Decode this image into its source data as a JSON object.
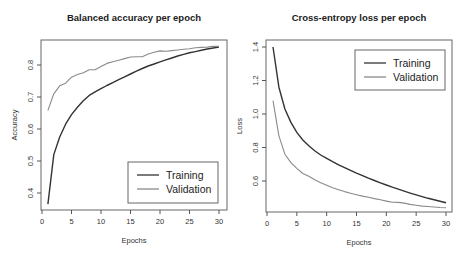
{
  "colors": {
    "training": "#333333",
    "validation": "#8a8a8a",
    "axis": "#555555",
    "box": "#666666"
  },
  "chart_data": [
    {
      "type": "line",
      "title": "Balanced accuracy per epoch",
      "xlabel": "Epochs",
      "ylabel": "Accuracy",
      "xlim": [
        0,
        30
      ],
      "ylim": [
        0.36,
        0.87
      ],
      "xticks": [
        0,
        5,
        10,
        15,
        20,
        25,
        30
      ],
      "yticks": [
        0.4,
        0.5,
        0.6,
        0.7,
        0.8
      ],
      "ytick_labels": [
        "0.4",
        "0.5",
        "0.6",
        "0.7",
        "0.8"
      ],
      "grid": false,
      "legend": {
        "position": "bottomright",
        "entries": [
          "Training",
          "Validation"
        ]
      },
      "x": [
        1,
        2,
        3,
        4,
        5,
        6,
        7,
        8,
        9,
        10,
        11,
        12,
        13,
        14,
        15,
        16,
        17,
        18,
        19,
        20,
        21,
        22,
        23,
        24,
        25,
        26,
        27,
        28,
        29,
        30
      ],
      "series": [
        {
          "name": "Training",
          "values": [
            0.365,
            0.52,
            0.575,
            0.615,
            0.645,
            0.668,
            0.688,
            0.705,
            0.716,
            0.726,
            0.736,
            0.745,
            0.754,
            0.763,
            0.772,
            0.781,
            0.789,
            0.797,
            0.803,
            0.81,
            0.816,
            0.822,
            0.828,
            0.833,
            0.838,
            0.842,
            0.846,
            0.85,
            0.853,
            0.856
          ]
        },
        {
          "name": "Validation",
          "values": [
            0.658,
            0.71,
            0.735,
            0.743,
            0.762,
            0.77,
            0.776,
            0.785,
            0.785,
            0.795,
            0.805,
            0.81,
            0.815,
            0.82,
            0.825,
            0.826,
            0.826,
            0.834,
            0.84,
            0.844,
            0.843,
            0.845,
            0.847,
            0.849,
            0.851,
            0.854,
            0.855,
            0.856,
            0.858,
            0.858
          ]
        }
      ]
    },
    {
      "type": "line",
      "title": "Cross-entropy loss per epoch",
      "xlabel": "Epochs",
      "ylabel": "Loss",
      "xlim": [
        0,
        30
      ],
      "ylim": [
        0.42,
        1.42
      ],
      "xticks": [
        0,
        5,
        10,
        15,
        20,
        25,
        30
      ],
      "yticks": [
        0.6,
        0.8,
        1.0,
        1.2,
        1.4
      ],
      "ytick_labels": [
        "0.6",
        "0.8",
        "1.0",
        "1.2",
        "1.4"
      ],
      "grid": false,
      "legend": {
        "position": "topright",
        "entries": [
          "Training",
          "Validation"
        ]
      },
      "x": [
        1,
        2,
        3,
        4,
        5,
        6,
        7,
        8,
        9,
        10,
        11,
        12,
        13,
        14,
        15,
        16,
        17,
        18,
        19,
        20,
        21,
        22,
        23,
        24,
        25,
        26,
        27,
        28,
        29,
        30
      ],
      "series": [
        {
          "name": "Training",
          "values": [
            1.4,
            1.16,
            1.03,
            0.95,
            0.89,
            0.845,
            0.81,
            0.78,
            0.755,
            0.735,
            0.715,
            0.697,
            0.68,
            0.663,
            0.647,
            0.632,
            0.617,
            0.603,
            0.589,
            0.576,
            0.563,
            0.551,
            0.539,
            0.528,
            0.517,
            0.507,
            0.497,
            0.488,
            0.479,
            0.47
          ]
        },
        {
          "name": "Validation",
          "values": [
            1.08,
            0.87,
            0.76,
            0.71,
            0.675,
            0.645,
            0.628,
            0.607,
            0.59,
            0.575,
            0.56,
            0.548,
            0.537,
            0.527,
            0.518,
            0.51,
            0.503,
            0.495,
            0.488,
            0.48,
            0.473,
            0.472,
            0.468,
            0.46,
            0.455,
            0.45,
            0.448,
            0.445,
            0.442,
            0.44
          ]
        }
      ]
    }
  ]
}
